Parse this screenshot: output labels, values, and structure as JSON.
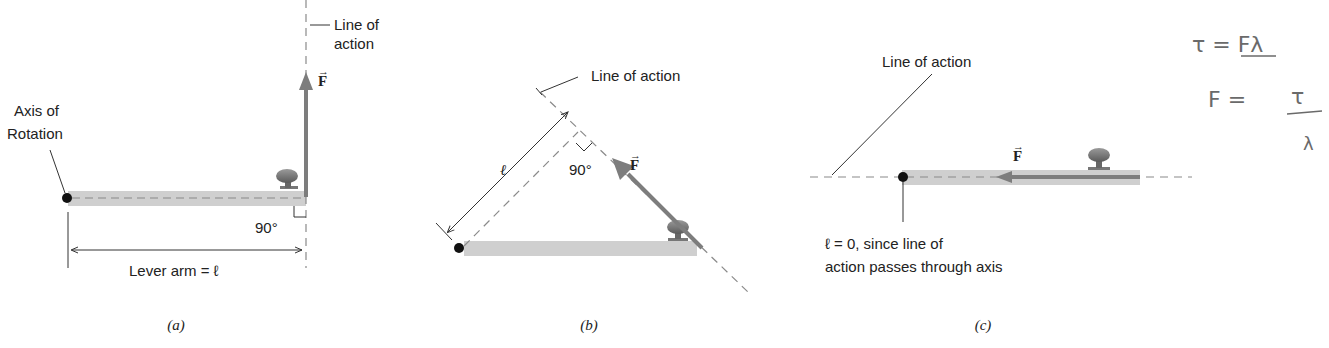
{
  "figure": {
    "panels": [
      {
        "id": "a",
        "caption": "(a)",
        "line_of_action_label": [
          "Line of",
          "action"
        ],
        "axis_label": [
          "Axis of",
          "Rotation"
        ],
        "angle_label": "90°",
        "lever_arm_label": "Lever arm = ℓ",
        "force_label": "F"
      },
      {
        "id": "b",
        "caption": "(b)",
        "line_of_action_label": "Line of action",
        "angle_label": "90°",
        "lever_arm_symbol": "ℓ",
        "force_label": "F"
      },
      {
        "id": "c",
        "caption": "(c)",
        "line_of_action_label": "Line of action",
        "note": [
          "ℓ = 0, since line of",
          "action passes through axis"
        ],
        "force_label": "F"
      }
    ],
    "handwritten_notes": {
      "line1": "τ = Fλ",
      "line2_lhs": "F =",
      "line2_num": "τ",
      "line2_den": "λ"
    },
    "colors": {
      "board": "#cfcfcf",
      "force_arrow": "#7d7d7d",
      "dashed_line": "#8a8a8a",
      "axis_dot": "#111111",
      "knob": "#6f6f6f"
    }
  }
}
